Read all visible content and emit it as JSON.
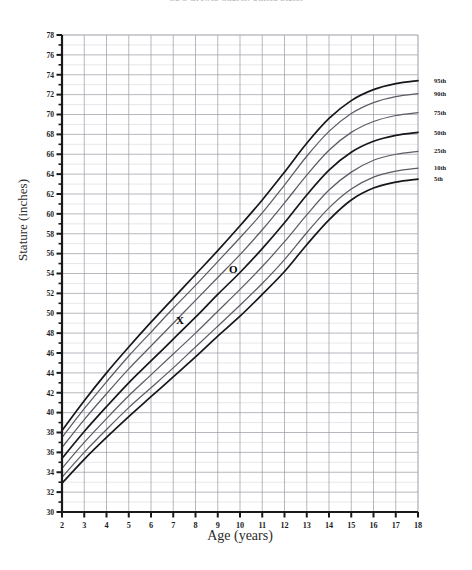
{
  "title": "CDC Growth Charts: United States",
  "chart_data": {
    "type": "line",
    "title": "CDC Growth Charts: United States",
    "subtitle": "",
    "xlabel": "Age (years)",
    "ylabel": "Stature (inches)",
    "xlim": [
      2,
      18
    ],
    "ylim": [
      30,
      78
    ],
    "grid": true,
    "legend_position": "right",
    "x_ticks": [
      2,
      3,
      4,
      5,
      6,
      7,
      8,
      9,
      10,
      11,
      12,
      13,
      14,
      15,
      16,
      17,
      18
    ],
    "y_ticks": [
      30,
      32,
      34,
      36,
      38,
      40,
      42,
      44,
      46,
      48,
      50,
      52,
      54,
      56,
      58,
      60,
      62,
      64,
      66,
      68,
      70,
      72,
      74,
      76,
      78
    ],
    "y_minor_step": 1,
    "x": [
      2,
      3,
      4,
      5,
      6,
      7,
      8,
      9,
      10,
      11,
      12,
      13,
      14,
      15,
      16,
      17,
      18
    ],
    "series": [
      {
        "name": "95th",
        "label": "95th",
        "emphasis": "heavy",
        "values": [
          38.2,
          41.2,
          44.0,
          46.6,
          49.1,
          51.5,
          53.9,
          56.3,
          58.8,
          61.4,
          64.2,
          67.1,
          69.6,
          71.4,
          72.5,
          73.1,
          73.4
        ]
      },
      {
        "name": "90th",
        "label": "90th",
        "emphasis": "light",
        "values": [
          37.5,
          40.4,
          43.1,
          45.7,
          48.1,
          50.5,
          52.8,
          55.2,
          57.6,
          60.1,
          62.9,
          65.8,
          68.3,
          70.1,
          71.2,
          71.8,
          72.1
        ]
      },
      {
        "name": "75th",
        "label": "75th",
        "emphasis": "light",
        "values": [
          36.5,
          39.3,
          41.9,
          44.4,
          46.7,
          49.0,
          51.3,
          53.6,
          55.9,
          58.4,
          61.1,
          63.9,
          66.4,
          68.2,
          69.3,
          69.9,
          70.2
        ]
      },
      {
        "name": "50th",
        "label": "50th",
        "emphasis": "heavy",
        "values": [
          35.4,
          38.1,
          40.6,
          43.0,
          45.2,
          47.4,
          49.6,
          51.9,
          54.1,
          56.5,
          59.1,
          61.9,
          64.4,
          66.2,
          67.3,
          67.9,
          68.2
        ]
      },
      {
        "name": "25th",
        "label": "25th",
        "emphasis": "light",
        "values": [
          34.4,
          37.0,
          39.4,
          41.7,
          43.8,
          45.9,
          48.0,
          50.2,
          52.4,
          54.7,
          57.2,
          59.9,
          62.4,
          64.2,
          65.4,
          66.0,
          66.3
        ]
      },
      {
        "name": "10th",
        "label": "10th",
        "emphasis": "light",
        "values": [
          33.5,
          36.0,
          38.3,
          40.5,
          42.5,
          44.5,
          46.6,
          48.7,
          50.8,
          53.0,
          55.4,
          58.1,
          60.6,
          62.5,
          63.7,
          64.3,
          64.6
        ]
      },
      {
        "name": "5th",
        "label": "5th",
        "emphasis": "heavy",
        "values": [
          32.9,
          35.3,
          37.5,
          39.6,
          41.6,
          43.6,
          45.6,
          47.7,
          49.7,
          51.9,
          54.2,
          56.9,
          59.4,
          61.4,
          62.6,
          63.2,
          63.5
        ]
      }
    ],
    "plotted_points": [
      {
        "label": "O",
        "marker": "circle-letter",
        "x": 9.7,
        "y": 54.5
      },
      {
        "label": "X",
        "marker": "x-letter",
        "x": 7.3,
        "y": 49.3
      }
    ]
  }
}
